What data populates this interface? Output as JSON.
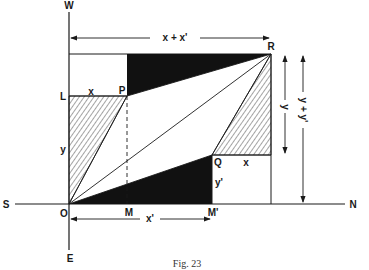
{
  "figure": {
    "caption": "Fig. 23",
    "colors": {
      "ink": "#1a1a1a",
      "fill_black": "#111111",
      "background": "#ffffff"
    }
  },
  "axes": {
    "west": "W",
    "east": "E",
    "south": "S",
    "north": "N"
  },
  "points": {
    "origin": "O",
    "L": "L",
    "P": "P",
    "R": "R",
    "Q": "Q",
    "M": "M",
    "M_prime": "M'"
  },
  "dimensions": {
    "top_span": "x + x'",
    "bottom_span": "x'",
    "LP_segment": "x",
    "Q_segment": "x",
    "left_height": "y",
    "Q_height": "y'",
    "right_y": "y",
    "right_y_total": "y + y'"
  }
}
